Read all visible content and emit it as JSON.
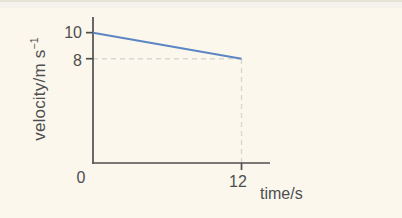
{
  "figure": {
    "y_axis_label_main": "velocity/m s",
    "y_axis_label_sup": "−1",
    "x_axis_label": "time/s"
  },
  "chart_data": {
    "type": "line",
    "title": "",
    "xlabel": "time/s",
    "ylabel": "velocity/m s^-1",
    "series": [
      {
        "name": "velocity",
        "x": [
          0,
          12
        ],
        "y": [
          10,
          8
        ],
        "color": "#5b86c3"
      }
    ],
    "x_origin_label": "0",
    "x_ticks": [
      {
        "value": 12,
        "label": "12"
      }
    ],
    "y_ticks": [
      {
        "value": 10,
        "label": "10"
      },
      {
        "value": 8,
        "label": "8"
      }
    ],
    "xlim": [
      0,
      14.3
    ],
    "ylim": [
      0,
      11.2
    ],
    "guides": [
      {
        "type": "horizontal-dashed",
        "y": 8,
        "x_from": 0,
        "x_to": 12
      },
      {
        "type": "vertical-dashed",
        "x": 12,
        "y_from": 0,
        "y_to": 8
      }
    ],
    "grid": false,
    "legend": false,
    "colors": {
      "axis": "#4f4f4f",
      "text": "#4d4e50",
      "line": "#5b86c3",
      "dash": "#d8d8d2",
      "background": "#fbf7ec"
    }
  }
}
